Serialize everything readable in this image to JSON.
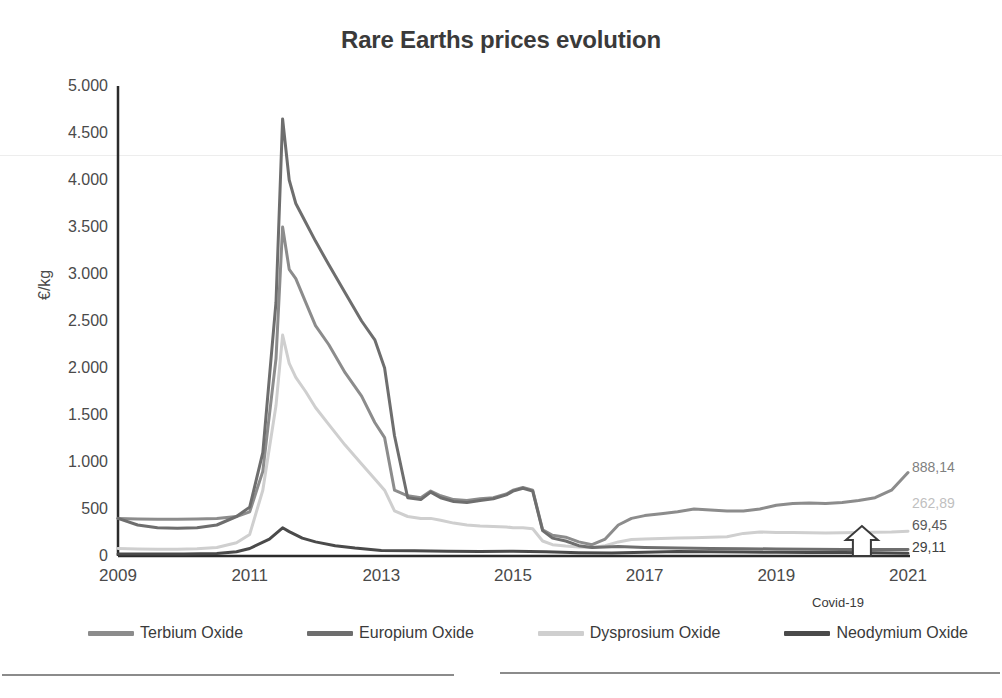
{
  "chart_data": {
    "type": "line",
    "title": "Rare Earths prices evolution",
    "xlabel": "",
    "ylabel": "€/kg",
    "ylim": [
      0,
      5000
    ],
    "xlim": [
      2009,
      2021
    ],
    "grid": false,
    "legend_position": "bottom",
    "ytick_labels": [
      "5.000",
      "4.500",
      "4.000",
      "3.500",
      "3.000",
      "2.500",
      "2.000",
      "1.500",
      "1.000",
      "500",
      "0"
    ],
    "ytick_values": [
      5000,
      4500,
      4000,
      3500,
      3000,
      2500,
      2000,
      1500,
      1000,
      500,
      0
    ],
    "xtick_labels": [
      "2009",
      "2011",
      "2013",
      "2015",
      "2017",
      "2019",
      "2021"
    ],
    "xtick_values": [
      2009,
      2011,
      2013,
      2015,
      2017,
      2019,
      2021
    ],
    "annotations": [
      {
        "text": "Covid-19",
        "x": 2020.3,
        "y": 0,
        "marker": "up-arrow"
      }
    ],
    "end_labels": [
      {
        "series": "Terbium Oxide",
        "value": "888,14",
        "color": "#7f7f7f"
      },
      {
        "series": "Dysprosium Oxide",
        "value": "262,89",
        "color": "#bfbfbf"
      },
      {
        "series": "Europium Oxide",
        "value": "69,45",
        "color": "#595959"
      },
      {
        "series": "Neodymium Oxide",
        "value": "29,11",
        "color": "#404040"
      }
    ],
    "series": [
      {
        "name": "Terbium Oxide",
        "color": "#8c8c8c",
        "width": 3,
        "x": [
          2009.0,
          2009.3,
          2009.6,
          2009.9,
          2010.2,
          2010.5,
          2010.8,
          2011.0,
          2011.2,
          2011.4,
          2011.5,
          2011.6,
          2011.7,
          2011.85,
          2012.0,
          2012.2,
          2012.45,
          2012.7,
          2012.9,
          2013.05,
          2013.2,
          2013.4,
          2013.6,
          2013.75,
          2013.9,
          2014.1,
          2014.3,
          2014.5,
          2014.7,
          2014.9,
          2015.0,
          2015.15,
          2015.3,
          2015.45,
          2015.6,
          2015.8,
          2016.0,
          2016.2,
          2016.4,
          2016.6,
          2016.8,
          2017.0,
          2017.25,
          2017.5,
          2017.75,
          2018.0,
          2018.25,
          2018.5,
          2018.75,
          2019.0,
          2019.25,
          2019.5,
          2019.75,
          2020.0,
          2020.25,
          2020.5,
          2020.75,
          2021.0
        ],
        "y": [
          400,
          395,
          390,
          390,
          395,
          400,
          420,
          470,
          900,
          2100,
          3500,
          3050,
          2950,
          2700,
          2450,
          2250,
          1950,
          1700,
          1420,
          1260,
          700,
          640,
          620,
          690,
          640,
          600,
          590,
          610,
          620,
          660,
          700,
          730,
          700,
          280,
          220,
          200,
          150,
          120,
          180,
          330,
          400,
          430,
          450,
          470,
          500,
          490,
          480,
          480,
          500,
          540,
          560,
          565,
          560,
          570,
          590,
          620,
          700,
          888
        ]
      },
      {
        "name": "Europium Oxide",
        "color": "#6e6e6e",
        "width": 3,
        "x": [
          2009.0,
          2009.3,
          2009.6,
          2009.9,
          2010.2,
          2010.5,
          2010.8,
          2011.0,
          2011.2,
          2011.4,
          2011.5,
          2011.6,
          2011.7,
          2011.85,
          2012.0,
          2012.2,
          2012.45,
          2012.7,
          2012.9,
          2013.05,
          2013.2,
          2013.4,
          2013.6,
          2013.75,
          2013.9,
          2014.1,
          2014.3,
          2014.5,
          2014.7,
          2014.9,
          2015.0,
          2015.15,
          2015.3,
          2015.45,
          2015.6,
          2015.8,
          2016.0,
          2016.2,
          2016.4,
          2016.6,
          2016.8,
          2017.0,
          2017.5,
          2018.0,
          2018.5,
          2019.0,
          2019.5,
          2020.0,
          2020.5,
          2021.0
        ],
        "y": [
          400,
          330,
          300,
          295,
          300,
          330,
          420,
          520,
          1100,
          2700,
          4650,
          4000,
          3750,
          3550,
          3350,
          3100,
          2800,
          2500,
          2300,
          2000,
          1280,
          620,
          600,
          680,
          620,
          580,
          570,
          590,
          610,
          650,
          690,
          720,
          690,
          270,
          190,
          160,
          110,
          90,
          95,
          100,
          95,
          90,
          85,
          80,
          78,
          75,
          72,
          70,
          68,
          69
        ]
      },
      {
        "name": "Dysprosium Oxide",
        "color": "#cfcfcf",
        "width": 3,
        "x": [
          2009.0,
          2009.3,
          2009.6,
          2009.9,
          2010.2,
          2010.5,
          2010.8,
          2011.0,
          2011.2,
          2011.4,
          2011.5,
          2011.6,
          2011.7,
          2011.85,
          2012.0,
          2012.2,
          2012.45,
          2012.7,
          2012.9,
          2013.05,
          2013.2,
          2013.4,
          2013.6,
          2013.75,
          2013.9,
          2014.1,
          2014.3,
          2014.5,
          2014.7,
          2014.9,
          2015.0,
          2015.15,
          2015.3,
          2015.45,
          2015.6,
          2015.8,
          2016.0,
          2016.2,
          2016.4,
          2016.6,
          2016.8,
          2017.0,
          2017.25,
          2017.5,
          2017.75,
          2018.0,
          2018.25,
          2018.5,
          2018.75,
          2019.0,
          2019.25,
          2019.5,
          2019.75,
          2020.0,
          2020.25,
          2020.5,
          2020.75,
          2021.0
        ],
        "y": [
          80,
          75,
          72,
          72,
          78,
          90,
          140,
          230,
          700,
          1600,
          2350,
          2050,
          1900,
          1750,
          1580,
          1400,
          1180,
          980,
          820,
          700,
          480,
          420,
          400,
          400,
          380,
          350,
          330,
          320,
          315,
          310,
          300,
          300,
          290,
          160,
          120,
          105,
          95,
          90,
          110,
          150,
          175,
          180,
          185,
          190,
          195,
          200,
          205,
          240,
          255,
          250,
          250,
          248,
          245,
          248,
          250,
          252,
          255,
          263
        ]
      },
      {
        "name": "Neodymium Oxide",
        "color": "#4a4a4a",
        "width": 3,
        "x": [
          2009.0,
          2009.5,
          2010.0,
          2010.5,
          2010.8,
          2011.0,
          2011.3,
          2011.5,
          2011.6,
          2011.8,
          2012.0,
          2012.3,
          2012.6,
          2013.0,
          2013.5,
          2014.0,
          2014.5,
          2015.0,
          2015.5,
          2016.0,
          2016.5,
          2017.0,
          2017.5,
          2018.0,
          2018.5,
          2019.0,
          2019.5,
          2020.0,
          2020.5,
          2021.0
        ],
        "y": [
          20,
          20,
          22,
          28,
          45,
          80,
          180,
          300,
          260,
          190,
          150,
          110,
          85,
          60,
          55,
          50,
          48,
          50,
          45,
          35,
          32,
          40,
          48,
          45,
          42,
          40,
          38,
          36,
          34,
          29
        ]
      }
    ]
  },
  "chart": {
    "title": "Rare Earths prices evolution",
    "y_axis_label": "€/kg",
    "y_ticks": [
      "5.000",
      "4.500",
      "4.000",
      "3.500",
      "3.000",
      "2.500",
      "2.000",
      "1.500",
      "1.000",
      "500",
      "0"
    ],
    "x_ticks": [
      "2009",
      "2011",
      "2013",
      "2015",
      "2017",
      "2019",
      "2021"
    ],
    "covid_annotation": "Covid-19",
    "end_labels": [
      "888,14",
      "262,89",
      "69,45",
      "29,11"
    ],
    "legend": [
      {
        "label": "Terbium Oxide",
        "color": "#8c8c8c"
      },
      {
        "label": "Europium Oxide",
        "color": "#6e6e6e"
      },
      {
        "label": "Dysprosium Oxide",
        "color": "#cfcfcf"
      },
      {
        "label": "Neodymium Oxide",
        "color": "#4a4a4a"
      }
    ]
  }
}
